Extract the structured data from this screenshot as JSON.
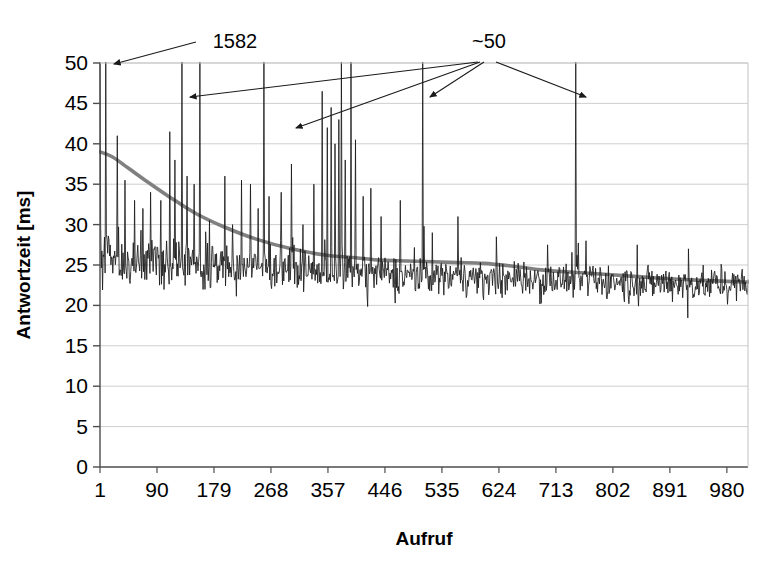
{
  "chart_data": {
    "type": "line",
    "title": "",
    "xlabel": "Aufruf",
    "ylabel": "Antwortzeit [ms]",
    "xlim": [
      1,
      1013
    ],
    "ylim": [
      0,
      50
    ],
    "grid": true,
    "legend": "none",
    "y_ticks": [
      0,
      5,
      10,
      15,
      20,
      25,
      30,
      35,
      40,
      45,
      50
    ],
    "y_tick_labels": [
      "0",
      "5",
      "10",
      "15",
      "20",
      "25",
      "30",
      "35",
      "40",
      "45",
      "50"
    ],
    "x_ticks": [
      1,
      90,
      179,
      268,
      357,
      446,
      535,
      624,
      713,
      802,
      891,
      980
    ],
    "x_tick_labels": [
      "1",
      "90",
      "179",
      "268",
      "357",
      "446",
      "535",
      "624",
      "713",
      "802",
      "891",
      "980"
    ],
    "series": [
      {
        "name": "Antwortzeit",
        "kind": "raw-response-time",
        "color": "#1a1a1a",
        "note": "Noisy per-call response time, clipped at the 50 ms axis maximum",
        "baseline_start_ms": 27.0,
        "baseline_end_ms": 22.5,
        "noise_amplitude_ms": 2.6,
        "clipped_spikes_x": [
          1,
          10,
          129,
          157,
          257,
          378,
          393,
          505,
          744
        ],
        "clipped_spike_peak_ms": 50,
        "first_spike_actual_ms": 1582,
        "outlier_spikes": [
          {
            "x": 28,
            "y": 41.0
          },
          {
            "x": 40,
            "y": 35.5
          },
          {
            "x": 55,
            "y": 33.0
          },
          {
            "x": 68,
            "y": 32.0
          },
          {
            "x": 80,
            "y": 34.0
          },
          {
            "x": 96,
            "y": 33.0
          },
          {
            "x": 110,
            "y": 41.5
          },
          {
            "x": 118,
            "y": 38.0
          },
          {
            "x": 137,
            "y": 36.0
          },
          {
            "x": 148,
            "y": 35.0
          },
          {
            "x": 172,
            "y": 30.5
          },
          {
            "x": 196,
            "y": 36.0
          },
          {
            "x": 208,
            "y": 30.0
          },
          {
            "x": 222,
            "y": 35.5
          },
          {
            "x": 236,
            "y": 35.0
          },
          {
            "x": 248,
            "y": 32.0
          },
          {
            "x": 265,
            "y": 33.5
          },
          {
            "x": 284,
            "y": 34.0
          },
          {
            "x": 300,
            "y": 37.5
          },
          {
            "x": 318,
            "y": 30.0
          },
          {
            "x": 335,
            "y": 35.0
          },
          {
            "x": 348,
            "y": 46.5
          },
          {
            "x": 356,
            "y": 42.0
          },
          {
            "x": 362,
            "y": 44.5
          },
          {
            "x": 368,
            "y": 40.0
          },
          {
            "x": 374,
            "y": 43.0
          },
          {
            "x": 384,
            "y": 38.0
          },
          {
            "x": 400,
            "y": 40.5
          },
          {
            "x": 412,
            "y": 33.5
          },
          {
            "x": 424,
            "y": 34.5
          },
          {
            "x": 440,
            "y": 31.0
          },
          {
            "x": 470,
            "y": 33.0
          },
          {
            "x": 520,
            "y": 29.0
          },
          {
            "x": 560,
            "y": 31.0
          },
          {
            "x": 620,
            "y": 28.5
          },
          {
            "x": 700,
            "y": 27.5
          },
          {
            "x": 760,
            "y": 28.0
          },
          {
            "x": 840,
            "y": 27.5
          },
          {
            "x": 920,
            "y": 27.0
          }
        ]
      },
      {
        "name": "Trend",
        "kind": "moving-average-trend",
        "color": "#808080",
        "points": [
          {
            "x": 1,
            "y": 39.0
          },
          {
            "x": 20,
            "y": 38.4
          },
          {
            "x": 45,
            "y": 37.0
          },
          {
            "x": 75,
            "y": 35.3
          },
          {
            "x": 110,
            "y": 33.4
          },
          {
            "x": 150,
            "y": 31.4
          },
          {
            "x": 195,
            "y": 29.7
          },
          {
            "x": 245,
            "y": 28.2
          },
          {
            "x": 300,
            "y": 27.0
          },
          {
            "x": 355,
            "y": 26.2
          },
          {
            "x": 400,
            "y": 25.9
          },
          {
            "x": 440,
            "y": 25.6
          },
          {
            "x": 480,
            "y": 25.5
          },
          {
            "x": 520,
            "y": 25.4
          },
          {
            "x": 560,
            "y": 25.3
          },
          {
            "x": 600,
            "y": 25.2
          },
          {
            "x": 640,
            "y": 24.9
          },
          {
            "x": 690,
            "y": 24.4
          },
          {
            "x": 740,
            "y": 24.1
          },
          {
            "x": 800,
            "y": 23.8
          },
          {
            "x": 870,
            "y": 23.4
          },
          {
            "x": 940,
            "y": 23.1
          },
          {
            "x": 1013,
            "y": 22.9
          }
        ]
      }
    ],
    "annotations": [
      {
        "id": "annot-1582",
        "label": "1582",
        "label_x": 235,
        "label_y": 48,
        "arrows": [
          {
            "x1": 196,
            "y1": 42,
            "x2": 114,
            "y2": 64
          }
        ]
      },
      {
        "id": "annot-approx-50",
        "label": "~50",
        "label_x": 489,
        "label_y": 48,
        "arrows": [
          {
            "x1": 478,
            "y1": 62,
            "x2": 190,
            "y2": 97
          },
          {
            "x1": 480,
            "y1": 62,
            "x2": 296,
            "y2": 128
          },
          {
            "x1": 484,
            "y1": 62,
            "x2": 430,
            "y2": 97
          },
          {
            "x1": 496,
            "y1": 62,
            "x2": 586,
            "y2": 97
          }
        ]
      }
    ]
  },
  "plot": {
    "left_px": 100,
    "right_px": 748,
    "top_px": 63,
    "bottom_px": 467,
    "grid_color": "#c8c8c8",
    "axis_color": "#4d4d4d",
    "data_color": "#1a1a1a",
    "trend_color": "#808080",
    "background": "#ffffff"
  }
}
